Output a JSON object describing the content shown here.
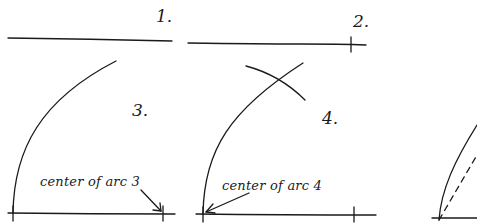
{
  "figure": {
    "type": "hand-drawn construction steps",
    "panels": [
      {
        "id": 1,
        "label": "1.",
        "description": "horizontal line"
      },
      {
        "id": 2,
        "label": "2.",
        "description": "horizontal line with tick mark near right end"
      },
      {
        "id": 3,
        "label": "3.",
        "annotation": "center of arc 3",
        "description": "arc drawn from left end, centered at right tick"
      },
      {
        "id": 4,
        "label": "4.",
        "annotation": "center of arc 4",
        "description": "second arc crossing first, centered at left end"
      },
      {
        "id": 5,
        "label": "",
        "description": "partial view: arc with dashed chord from left end"
      }
    ]
  },
  "colors": {
    "ink": "#1a1a1a",
    "background": "#ffffff"
  }
}
